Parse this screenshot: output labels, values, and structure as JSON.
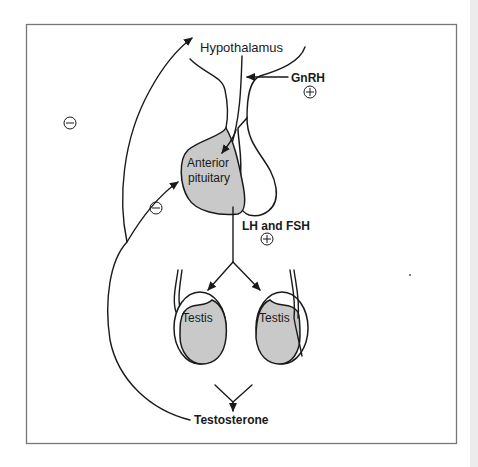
{
  "diagram": {
    "labels": {
      "hypothalamus": "Hypothalamus",
      "gnrh": "GnRH",
      "anterior_pituitary_line1": "Anterior",
      "anterior_pituitary_line2": "pituitary",
      "lh_fsh": "LH and FSH",
      "testis_left": "Testis",
      "testis_right": "Testis",
      "testosterone": "Testosterone"
    },
    "signs": {
      "gnrh_effect": "+",
      "lh_fsh_effect": "+",
      "feedback_hypothalamus": "−",
      "feedback_pituitary": "−"
    },
    "colors": {
      "line": "#1a1a1a",
      "gland_fill": "#c9c9c9",
      "frame": "#777777",
      "background": "#ffffff"
    }
  }
}
